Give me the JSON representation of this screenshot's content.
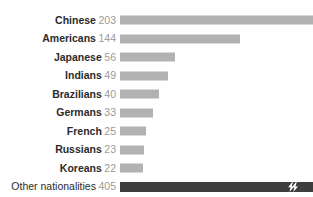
{
  "chart_data": {
    "type": "bar",
    "orientation": "horizontal",
    "title": "",
    "subtitle": "",
    "xlabel": "",
    "ylabel": "",
    "grid": false,
    "legend": null,
    "axis_break": true,
    "axis_break_note": "lightning-bolt break mark on the 'Other nationalities' bar indicating a truncated axis",
    "xlim": [
      0,
      203
    ],
    "categories": [
      "Chinese",
      "Americans",
      "Japanese",
      "Indians",
      "Brazilians",
      "Germans",
      "French",
      "Russians",
      "Koreans",
      "Other nationalities"
    ],
    "values": [
      203,
      144,
      56,
      49,
      40,
      33,
      25,
      23,
      22,
      405
    ],
    "bars": [
      {
        "label": "Chinese",
        "value": 203,
        "value_text": "203",
        "width_pct": 100.0,
        "style": "light",
        "clipped": true,
        "break": false
      },
      {
        "label": "Americans",
        "value": 144,
        "value_text": "144",
        "width_pct": 62.0,
        "style": "light",
        "clipped": false,
        "break": false
      },
      {
        "label": "Japanese",
        "value": 56,
        "value_text": "56",
        "width_pct": 28.5,
        "style": "light",
        "clipped": false,
        "break": false
      },
      {
        "label": "Indians",
        "value": 49,
        "value_text": "49",
        "width_pct": 24.9,
        "style": "light",
        "clipped": false,
        "break": false
      },
      {
        "label": "Brazilians",
        "value": 40,
        "value_text": "40",
        "width_pct": 20.4,
        "style": "light",
        "clipped": false,
        "break": false
      },
      {
        "label": "Germans",
        "value": 33,
        "value_text": "33",
        "width_pct": 17.3,
        "style": "light",
        "clipped": false,
        "break": false
      },
      {
        "label": "French",
        "value": 25,
        "value_text": "25",
        "width_pct": 13.3,
        "style": "light",
        "clipped": false,
        "break": false
      },
      {
        "label": "Russians",
        "value": 23,
        "value_text": "23",
        "width_pct": 12.3,
        "style": "light",
        "clipped": false,
        "break": false
      },
      {
        "label": "Koreans",
        "value": 22,
        "value_text": "22",
        "width_pct": 11.8,
        "style": "light",
        "clipped": false,
        "break": false
      },
      {
        "label": "Other nationalities",
        "value": 405,
        "value_text": "405",
        "width_pct": 100.0,
        "style": "dark",
        "clipped": true,
        "break": true
      }
    ],
    "colors": {
      "bar_light": "#b2b2b2",
      "bar_dark": "#3e3e3e",
      "label_text": "#2b2b2b",
      "value_text": "#9a9a9a",
      "background": "#ffffff"
    }
  }
}
